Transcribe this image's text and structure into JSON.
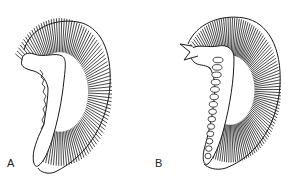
{
  "figure": {
    "panels": [
      {
        "label": "A",
        "description": "Crescent-shaped striated structure with wavy, irregular inner margin"
      },
      {
        "label": "B",
        "description": "Crescent-shaped striated structure with row of looped lamellae along inner margin"
      }
    ],
    "colors": {
      "ink": "#1a1a1a",
      "background": "#ffffff"
    }
  }
}
